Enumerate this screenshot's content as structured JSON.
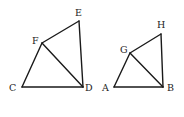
{
  "figures": [
    {
      "name": "quadrilateral-CDEF",
      "vertices": {
        "C": {
          "x": 22,
          "y": 87,
          "label": "C",
          "lx": 9,
          "ly": 91
        },
        "D": {
          "x": 83,
          "y": 87,
          "label": "D",
          "lx": 85,
          "ly": 91
        },
        "E": {
          "x": 79,
          "y": 21,
          "label": "E",
          "lx": 75,
          "ly": 16
        },
        "F": {
          "x": 42,
          "y": 43,
          "label": "F",
          "lx": 32,
          "ly": 44
        }
      },
      "edges": [
        [
          "C",
          "D"
        ],
        [
          "D",
          "E"
        ],
        [
          "E",
          "F"
        ],
        [
          "F",
          "C"
        ],
        [
          "F",
          "D"
        ]
      ]
    },
    {
      "name": "quadrilateral-ABHG",
      "vertices": {
        "A": {
          "x": 114,
          "y": 87,
          "label": "A",
          "lx": 102,
          "ly": 91
        },
        "B": {
          "x": 163,
          "y": 87,
          "label": "B",
          "lx": 167,
          "ly": 91
        },
        "H": {
          "x": 161,
          "y": 34,
          "label": "H",
          "lx": 157,
          "ly": 28
        },
        "G": {
          "x": 130,
          "y": 53,
          "label": "G",
          "lx": 120,
          "ly": 53
        }
      },
      "edges": [
        [
          "A",
          "B"
        ],
        [
          "B",
          "H"
        ],
        [
          "H",
          "G"
        ],
        [
          "G",
          "A"
        ],
        [
          "G",
          "B"
        ]
      ]
    }
  ]
}
